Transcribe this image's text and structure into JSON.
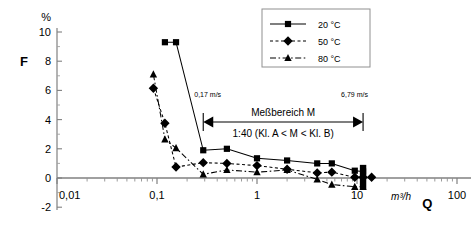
{
  "chart_data": {
    "type": "line",
    "title": "",
    "xlabel": "Q",
    "xunit": "m³/h",
    "ylabel": "F",
    "yunit": "%",
    "xscale": "log",
    "xlim": [
      0.01,
      100
    ],
    "ylim": [
      -2,
      10
    ],
    "xticks": [
      "0,01",
      "0,1",
      "1",
      "10",
      "100"
    ],
    "xtick_values": [
      0.01,
      0.1,
      1,
      10,
      100
    ],
    "yticks": [
      "-2",
      "0",
      "2",
      "4",
      "6",
      "8",
      "10"
    ],
    "ytick_values": [
      -2,
      0,
      2,
      4,
      6,
      8,
      10
    ],
    "grid": false,
    "legend_position": "top-right",
    "series": [
      {
        "name": "20 °C",
        "marker": "square",
        "line": "solid",
        "color": "#000000",
        "points": [
          {
            "x": 0.12,
            "y": 9.3
          },
          {
            "x": 0.155,
            "y": 9.3
          },
          {
            "x": 0.29,
            "y": 1.9
          },
          {
            "x": 0.5,
            "y": 2.0
          },
          {
            "x": 1.0,
            "y": 1.35
          },
          {
            "x": 2.0,
            "y": 1.2
          },
          {
            "x": 4.0,
            "y": 1.0
          },
          {
            "x": 5.6,
            "y": 1.0
          },
          {
            "x": 9.5,
            "y": 0.5
          },
          {
            "x": 11.5,
            "y": 0.45
          }
        ]
      },
      {
        "name": "50 °C",
        "marker": "diamond",
        "line": "dotted",
        "color": "#000000",
        "points": [
          {
            "x": 0.092,
            "y": 6.15
          },
          {
            "x": 0.12,
            "y": 3.75
          },
          {
            "x": 0.155,
            "y": 0.75
          },
          {
            "x": 0.29,
            "y": 1.05
          },
          {
            "x": 0.5,
            "y": 1.0
          },
          {
            "x": 1.0,
            "y": 0.85
          },
          {
            "x": 2.0,
            "y": 0.6
          },
          {
            "x": 4.0,
            "y": 0.35
          },
          {
            "x": 5.6,
            "y": 0.4
          },
          {
            "x": 9.5,
            "y": 0.05
          },
          {
            "x": 11.5,
            "y": 0.05
          },
          {
            "x": 14.0,
            "y": 0.05
          }
        ]
      },
      {
        "name": "80 °C",
        "marker": "triangle",
        "line": "dashdot",
        "color": "#000000",
        "points": [
          {
            "x": 0.092,
            "y": 7.1
          },
          {
            "x": 0.12,
            "y": 2.65
          },
          {
            "x": 0.155,
            "y": 2.05
          },
          {
            "x": 0.29,
            "y": 0.25
          },
          {
            "x": 0.5,
            "y": 0.55
          },
          {
            "x": 1.0,
            "y": 0.4
          },
          {
            "x": 2.0,
            "y": 0.55
          },
          {
            "x": 4.0,
            "y": -0.1
          },
          {
            "x": 5.6,
            "y": -0.45
          },
          {
            "x": 9.5,
            "y": -0.6
          },
          {
            "x": 11.5,
            "y": -0.6
          }
        ]
      }
    ],
    "annotations": {
      "range_label_line1": "Meßbereich M",
      "range_label_line2": "1:40 (Kl. A < M < Kl. B)",
      "range_start_x": 0.29,
      "range_end_x": 11.5,
      "velocity_left": "0,17 m/s",
      "velocity_right": "6,79 m/s",
      "max_flow_bar_x": 11.5
    }
  },
  "legend": {
    "entries": [
      {
        "label": "20 °C"
      },
      {
        "label": "50 °C"
      },
      {
        "label": "80 °C"
      }
    ]
  }
}
